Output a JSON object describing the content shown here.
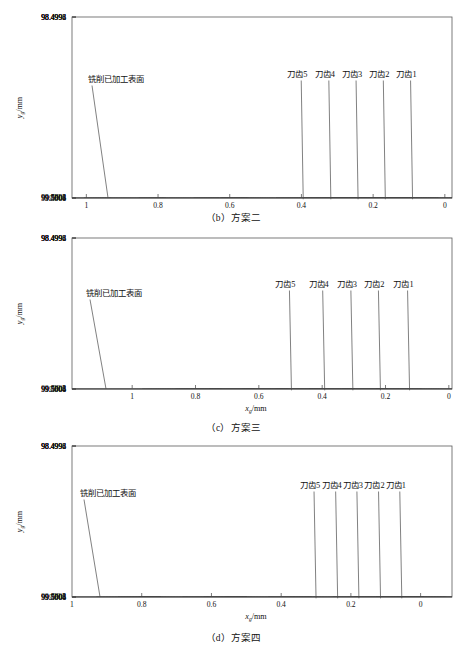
{
  "figure": {
    "panels": [
      {
        "id": "b",
        "caption": "（b）方案二",
        "annotation_surface": "铣削已加工表面",
        "tooth_labels": [
          "刀齿5",
          "刀齿4",
          "刀齿3",
          "刀齿2",
          "刀齿1"
        ],
        "chart_data": {
          "type": "line",
          "title": "",
          "xlabel": "x_g/mm",
          "ylabel": "y_g/mm",
          "xlim": [
            1.04,
            -0.02
          ],
          "ylim": [
            98.4992,
            99.501
          ],
          "xticks": [
            1,
            0.8,
            0.6,
            0.4,
            0.2,
            0
          ],
          "xticklabels": [
            "1",
            "0.8",
            "0.6",
            "0.4",
            "0.2",
            "0"
          ],
          "yticks": [
            98.4992,
            98.4994,
            98.4996,
            98.4998,
            99.5,
            99.5002,
            99.5004,
            99.5006,
            99.5008,
            99.501
          ],
          "yticklabels": [
            "98.4992",
            "98.4994",
            "98.4996",
            "98.4998",
            "99.5",
            "99.5002",
            "99.5004",
            "99.5006",
            "99.5008",
            "99.501"
          ],
          "grid": false,
          "legend": "none",
          "surface_level": 99.50006,
          "arc_half_width": 0.112,
          "arc_peak": 99.49987,
          "arc_depth": 99.5012,
          "arc_peaks_x": [
            0.895,
            0.818,
            0.742,
            0.665,
            0.589,
            0.512,
            0.436,
            0.359,
            0.283,
            0.206,
            0.13,
            0.053
          ],
          "arc_shades": [
            "dark",
            "light",
            "dark",
            "light",
            "dark",
            "dark",
            "light",
            "dark",
            "dark",
            "dark",
            "dark",
            "dark"
          ],
          "tooth_marker_x": [
            0.395,
            0.318,
            0.242,
            0.166,
            0.09
          ]
        }
      },
      {
        "id": "c",
        "caption": "（c）方案三",
        "annotation_surface": "铣削已加工表面",
        "tooth_labels": [
          "刀齿5",
          "刀齿4",
          "刀齿3",
          "刀齿2",
          "刀齿1"
        ],
        "chart_data": {
          "type": "line",
          "title": "",
          "xlabel": "x_g/mm",
          "ylabel": "y_g/mm",
          "xlim": [
            1.19,
            -0.01
          ],
          "ylim": [
            98.4992,
            99.501
          ],
          "xticks": [
            1,
            0.8,
            0.6,
            0.4,
            0.2,
            0
          ],
          "xticklabels": [
            "1",
            "0.8",
            "0.6",
            "0.4",
            "0.2",
            "0"
          ],
          "yticks": [
            98.4992,
            98.4994,
            98.4996,
            98.4998,
            99.5,
            99.5002,
            99.5004,
            99.5006,
            99.5008,
            99.501
          ],
          "yticklabels": [
            "98.4992",
            "98.4994",
            "98.4996",
            "98.4998",
            "99.5",
            "99.5002",
            "99.5004",
            "99.5006",
            "99.5008",
            "99.501"
          ],
          "grid": false,
          "legend": "none",
          "surface_level": 99.50012,
          "arc_half_width": 0.125,
          "arc_peak": 99.4999,
          "arc_depth": 99.5013,
          "arc_peaks_x": [
            0.948,
            0.843,
            0.738,
            0.632,
            0.527,
            0.422,
            0.317,
            0.211,
            0.106
          ],
          "arc_shades": [
            "light",
            "dark",
            "dark",
            "dark",
            "dark",
            "dark",
            "dark",
            "dark",
            "dark"
          ],
          "tooth_marker_x": [
            0.497,
            0.392,
            0.303,
            0.216,
            0.124
          ]
        }
      },
      {
        "id": "d",
        "caption": "（d）方案四",
        "annotation_surface": "铣削已加工表面",
        "tooth_labels": [
          "刀齿5",
          "刀齿4",
          "刀齿3",
          "刀齿2",
          "刀齿1"
        ],
        "chart_data": {
          "type": "line",
          "title": "",
          "xlabel": "x_g/mm",
          "ylabel": "y_g/mm",
          "xlim": [
            1.0,
            -0.09
          ],
          "ylim": [
            98.4992,
            99.501
          ],
          "xticks": [
            0.8,
            0.6,
            0.4,
            0.2,
            0
          ],
          "xticklabels": [
            "0.8",
            "0.6",
            "0.4",
            "0.2",
            "0"
          ],
          "leftlabel": "1",
          "yticks": [
            98.4992,
            98.4994,
            98.4996,
            98.4998,
            99.5,
            99.5002,
            99.5004,
            99.5006,
            99.5008,
            99.501
          ],
          "yticklabels": [
            "98.4992",
            "98.4994",
            "98.4996",
            "98.4998",
            "99.5",
            "99.5002",
            "99.5004",
            "99.5006",
            "99.5008",
            "99.501"
          ],
          "grid": false,
          "legend": "none",
          "surface_level": 99.50007,
          "arc_half_width": 0.1,
          "arc_peak": 99.49988,
          "arc_depth": 99.5012,
          "arc_peaks_x": [
            0.83,
            0.768,
            0.707,
            0.645,
            0.583,
            0.522,
            0.46,
            0.398,
            0.337,
            0.275,
            0.213,
            0.152,
            0.09,
            0.028,
            -0.033
          ],
          "arc_shades": [
            "dark",
            "dark",
            "dark",
            "light",
            "dark",
            "dark",
            "dark",
            "light",
            "dark",
            "dark",
            "light",
            "dark",
            "dark",
            "dark",
            "dark"
          ],
          "tooth_marker_x": [
            0.3,
            0.238,
            0.177,
            0.115,
            0.054
          ]
        }
      }
    ]
  }
}
